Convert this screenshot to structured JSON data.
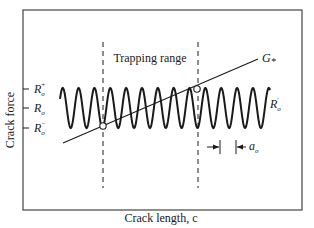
{
  "figure": {
    "title_label": "Trapping range",
    "x_axis_label": "Crack length, c",
    "y_axis_label": "Crack force",
    "y_ticks": [
      {
        "symbol": "R",
        "sub": "o",
        "sup": "+"
      },
      {
        "symbol": "R",
        "sub": "o",
        "sup": ""
      },
      {
        "symbol": "R",
        "sub": "o",
        "sup": "−"
      }
    ],
    "curve_label": {
      "symbol": "G",
      "sub": "*"
    },
    "wave_label": {
      "symbol": "R",
      "sub": "o",
      "sup": "'"
    },
    "period_label": {
      "symbol": "a",
      "sub": "o"
    },
    "wave_cycles": 13,
    "colors": {
      "ink": "#1a1a1a",
      "frame": "#444444"
    }
  }
}
